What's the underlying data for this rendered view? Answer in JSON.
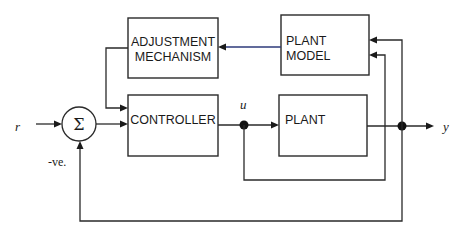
{
  "diagram": {
    "type": "block-diagram",
    "title": "",
    "blocks": {
      "adjustment_mechanism": {
        "line1": "ADJUSTMENT",
        "line2": "MECHANISM"
      },
      "plant_model": {
        "line1": "PLANT",
        "line2": "MODEL"
      },
      "controller": {
        "label": "CONTROLLER"
      },
      "plant": {
        "label": "PLANT"
      }
    },
    "summing_junction": {
      "symbol": "Σ",
      "negative_label": "-ve."
    },
    "signals": {
      "reference": "r",
      "control": "u",
      "output": "y"
    },
    "connections": [
      {
        "from": "r",
        "to": "summing_junction"
      },
      {
        "from": "summing_junction",
        "to": "controller"
      },
      {
        "from": "controller",
        "to": "u-node"
      },
      {
        "from": "u-node",
        "to": "plant"
      },
      {
        "from": "plant",
        "to": "y-node"
      },
      {
        "from": "y-node",
        "to": "y"
      },
      {
        "from": "u-node",
        "to": "plant_model",
        "note": "inner loop"
      },
      {
        "from": "y-node",
        "to": "plant_model"
      },
      {
        "from": "plant_model",
        "to": "adjustment_mechanism"
      },
      {
        "from": "adjustment_mechanism",
        "to": "controller"
      },
      {
        "from": "y-node",
        "to": "summing_junction",
        "sign": "negative"
      }
    ]
  }
}
